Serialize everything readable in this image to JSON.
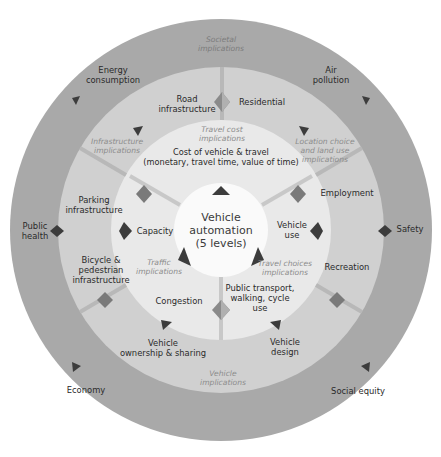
{
  "diagram": {
    "center": {
      "label": "Vehicle\nautomation\n(5 levels)"
    },
    "colors": {
      "outer_ring": "#a8a8a8",
      "middle_ring": "#cfcfcf",
      "inner_ring": "#e9e9e9",
      "center": "#fafafa",
      "arrow_dark": "#3c3c3c",
      "arrow_light": "#8a8a8a",
      "divider": "#b5b5b5"
    },
    "inner_ring": {
      "cost": "Cost of vehicle & travel\n(monetary, travel time, value of time)",
      "capacity": "Capacity",
      "vehicle_use": "Vehicle\nuse",
      "congestion": "Congestion",
      "public_transport": "Public transport,\nwalking, cycle\nuse",
      "travel_cost_implications": "Travel cost\nimplications",
      "traffic_implications": "Traffic\nimplications",
      "travel_choices_implications": "Travel choices\nimplications"
    },
    "middle_ring": {
      "road_infrastructure": "Road\ninfrastructure",
      "residential": "Residential",
      "parking_infrastructure": "Parking\ninfrastructure",
      "employment": "Employment",
      "bicycle_pedestrian": "Bicycle &\npedestrian\ninfrastructure",
      "recreation": "Recreation",
      "vehicle_ownership": "Vehicle\nownership & sharing",
      "vehicle_design": "Vehicle\ndesign",
      "infrastructure_implications": "Infrastructure\nimplications",
      "location_choice_implications": "Location choice\nand land use\nimplications",
      "vehicle_implications": "Vehicle\nimplications"
    },
    "outer_ring": {
      "societal_implications": "Societal\nimplications",
      "energy_consumption": "Energy\nconsumption",
      "air_pollution": "Air\npollution",
      "public_health": "Public\nhealth",
      "safety": "Safety",
      "economy": "Economy",
      "social_equity": "Social equity"
    }
  }
}
